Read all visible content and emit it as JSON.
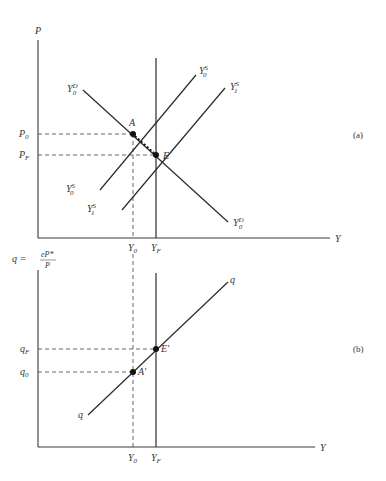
{
  "panel_a": {
    "tag": "(a)",
    "y_axis_label": "P",
    "x_axis_label": "Y",
    "price_labels": {
      "p0": "P",
      "p0_sub": "0",
      "pf": "P",
      "pf_sub": "F"
    },
    "output_labels": {
      "y0": "Y",
      "y0_sub": "0",
      "yf": "Y",
      "yf_sub": "F"
    },
    "curves": {
      "demand": {
        "name": "Y",
        "sup": "D",
        "sub": "0"
      },
      "supply0": {
        "name": "Y",
        "sup": "S",
        "sub": "0"
      },
      "supply1": {
        "name": "Y",
        "sup": "S",
        "sub": "1"
      }
    },
    "points": {
      "a": "A",
      "e": "E"
    }
  },
  "panel_b": {
    "tag": "(b)",
    "y_axis_label": "q = ",
    "y_axis_frac_num": "eP*",
    "y_axis_frac_den": "P",
    "x_axis_label": "Y",
    "q_labels": {
      "qf": "q",
      "qf_sub": "F",
      "q0": "q",
      "q0_sub": "0"
    },
    "output_labels": {
      "y0": "Y",
      "y0_sub": "0",
      "yf": "Y",
      "yf_sub": "F"
    },
    "curve": {
      "name": "q"
    },
    "points": {
      "a": "A'",
      "e": "E'"
    }
  }
}
